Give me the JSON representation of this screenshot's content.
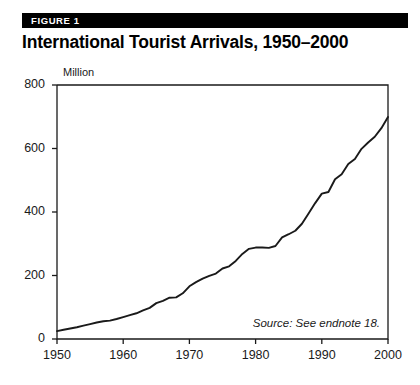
{
  "figure": {
    "badge": "FIGURE 1",
    "title": "International Tourist Arrivals, 1950–2000",
    "source_note": "Source: See endnote 18.",
    "badge_bg_color": "#000000",
    "badge_text_color": "#ffffff",
    "line_color": "#1a1a1a",
    "axis_color": "#1a1a1a",
    "background_color": "#ffffff"
  },
  "chart_data": {
    "type": "line",
    "title": "International Tourist Arrivals, 1950–2000",
    "subtitle": "FIGURE 1",
    "xlabel": "",
    "ylabel": "Million",
    "unit_label": "Million",
    "xlim": [
      1950,
      2000
    ],
    "ylim": [
      0,
      800
    ],
    "yticks": [
      0,
      200,
      400,
      600,
      800
    ],
    "ytick_labels": [
      "0",
      "200",
      "400",
      "600",
      "800"
    ],
    "xticks": [
      1950,
      1960,
      1970,
      1980,
      1990,
      2000
    ],
    "xtick_labels": [
      "1950",
      "1960",
      "1970",
      "1980",
      "1990",
      "2000"
    ],
    "grid": false,
    "legend": false,
    "annotations": [
      "Source: See endnote 18."
    ],
    "series": [
      {
        "name": "International tourist arrivals",
        "x": [
          1950,
          1951,
          1952,
          1953,
          1954,
          1955,
          1956,
          1957,
          1958,
          1959,
          1960,
          1961,
          1962,
          1963,
          1964,
          1965,
          1966,
          1967,
          1968,
          1969,
          1970,
          1971,
          1972,
          1973,
          1974,
          1975,
          1976,
          1977,
          1978,
          1979,
          1980,
          1981,
          1982,
          1983,
          1984,
          1985,
          1986,
          1987,
          1988,
          1989,
          1990,
          1991,
          1992,
          1993,
          1994,
          1995,
          1996,
          1997,
          1998,
          1999,
          2000
        ],
        "values": [
          25,
          29,
          33,
          37,
          42,
          47,
          52,
          56,
          58,
          63,
          69,
          75,
          81,
          90,
          98,
          113,
          120,
          130,
          131,
          144,
          166,
          179,
          190,
          199,
          206,
          222,
          229,
          246,
          268,
          284,
          288,
          288,
          287,
          293,
          320,
          330,
          341,
          363,
          395,
          428,
          458,
          463,
          503,
          519,
          551,
          567,
          599,
          619,
          637,
          664,
          699
        ]
      }
    ]
  }
}
